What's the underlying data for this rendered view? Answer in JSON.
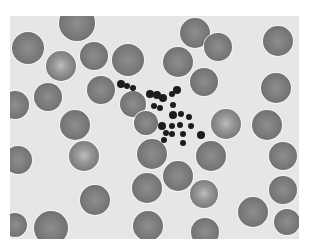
{
  "image": {
    "subject": "blood smear micrograph",
    "description": "Grayscale light micrograph of red blood cells with a central clump of dark platelets",
    "colors": {
      "background": "#e6e6e6",
      "cell": "#7c7c7c",
      "cell_pale_center": "#bdbdbd",
      "platelet": "#1c1c1c",
      "border": "#ffffff"
    },
    "frame": {
      "x": 10,
      "y": 16,
      "width": 289,
      "height": 223
    }
  },
  "cells": [
    {
      "x": 28,
      "y": 48,
      "r": 16,
      "pale": false
    },
    {
      "x": 77,
      "y": 23,
      "r": 18,
      "pale": false
    },
    {
      "x": 61,
      "y": 66,
      "r": 15,
      "pale": true
    },
    {
      "x": 94,
      "y": 56,
      "r": 14,
      "pale": false
    },
    {
      "x": 128,
      "y": 60,
      "r": 16,
      "pale": false
    },
    {
      "x": 178,
      "y": 62,
      "r": 15,
      "pale": false
    },
    {
      "x": 195,
      "y": 33,
      "r": 15,
      "pale": false
    },
    {
      "x": 218,
      "y": 47,
      "r": 14,
      "pale": false
    },
    {
      "x": 278,
      "y": 41,
      "r": 15,
      "pale": false
    },
    {
      "x": 48,
      "y": 97,
      "r": 14,
      "pale": false
    },
    {
      "x": 101,
      "y": 90,
      "r": 14,
      "pale": false
    },
    {
      "x": 204,
      "y": 82,
      "r": 14,
      "pale": false
    },
    {
      "x": 276,
      "y": 88,
      "r": 15,
      "pale": false
    },
    {
      "x": 15,
      "y": 105,
      "r": 14,
      "pale": false
    },
    {
      "x": 133,
      "y": 104,
      "r": 13,
      "pale": false
    },
    {
      "x": 146,
      "y": 123,
      "r": 12,
      "pale": false
    },
    {
      "x": 75,
      "y": 125,
      "r": 15,
      "pale": false
    },
    {
      "x": 226,
      "y": 124,
      "r": 15,
      "pale": true
    },
    {
      "x": 267,
      "y": 125,
      "r": 15,
      "pale": false
    },
    {
      "x": 84,
      "y": 156,
      "r": 15,
      "pale": true
    },
    {
      "x": 152,
      "y": 154,
      "r": 15,
      "pale": false
    },
    {
      "x": 211,
      "y": 156,
      "r": 15,
      "pale": false
    },
    {
      "x": 283,
      "y": 156,
      "r": 14,
      "pale": false
    },
    {
      "x": 18,
      "y": 160,
      "r": 14,
      "pale": false
    },
    {
      "x": 178,
      "y": 176,
      "r": 15,
      "pale": false
    },
    {
      "x": 147,
      "y": 188,
      "r": 15,
      "pale": false
    },
    {
      "x": 204,
      "y": 194,
      "r": 14,
      "pale": true
    },
    {
      "x": 95,
      "y": 200,
      "r": 15,
      "pale": false
    },
    {
      "x": 283,
      "y": 190,
      "r": 14,
      "pale": false
    },
    {
      "x": 253,
      "y": 212,
      "r": 15,
      "pale": false
    },
    {
      "x": 148,
      "y": 226,
      "r": 15,
      "pale": false
    },
    {
      "x": 51,
      "y": 228,
      "r": 17,
      "pale": false
    },
    {
      "x": 287,
      "y": 222,
      "r": 13,
      "pale": false
    },
    {
      "x": 205,
      "y": 232,
      "r": 14,
      "pale": false
    },
    {
      "x": 15,
      "y": 225,
      "r": 12,
      "pale": false
    }
  ],
  "platelets": [
    {
      "x": 121,
      "y": 84,
      "r": 4
    },
    {
      "x": 127,
      "y": 86,
      "r": 3
    },
    {
      "x": 133,
      "y": 88,
      "r": 3
    },
    {
      "x": 150,
      "y": 94,
      "r": 4
    },
    {
      "x": 157,
      "y": 95,
      "r": 4
    },
    {
      "x": 163,
      "y": 98,
      "r": 4
    },
    {
      "x": 177,
      "y": 90,
      "r": 4
    },
    {
      "x": 172,
      "y": 94,
      "r": 3
    },
    {
      "x": 154,
      "y": 106,
      "r": 3
    },
    {
      "x": 160,
      "y": 108,
      "r": 3
    },
    {
      "x": 173,
      "y": 105,
      "r": 3
    },
    {
      "x": 173,
      "y": 115,
      "r": 4
    },
    {
      "x": 181,
      "y": 114,
      "r": 3
    },
    {
      "x": 189,
      "y": 117,
      "r": 3
    },
    {
      "x": 162,
      "y": 126,
      "r": 4
    },
    {
      "x": 172,
      "y": 126,
      "r": 3
    },
    {
      "x": 180,
      "y": 125,
      "r": 3
    },
    {
      "x": 191,
      "y": 126,
      "r": 3
    },
    {
      "x": 172,
      "y": 134,
      "r": 3
    },
    {
      "x": 183,
      "y": 134,
      "r": 3
    },
    {
      "x": 201,
      "y": 135,
      "r": 4
    },
    {
      "x": 164,
      "y": 140,
      "r": 3
    },
    {
      "x": 183,
      "y": 143,
      "r": 3
    },
    {
      "x": 166,
      "y": 133,
      "r": 3
    }
  ]
}
